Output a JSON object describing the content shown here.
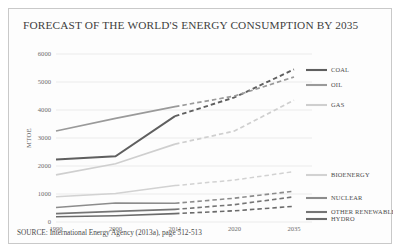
{
  "chart_data": {
    "type": "line",
    "title": "FORECAST OF THE WORLD'S ENERGY CONSUMPTION BY 2035",
    "source": "SOURCE: International Energy Agency (2013a), page 512-513",
    "xlabel": "",
    "ylabel": "MTOE",
    "categories": [
      "1990",
      "2000",
      "2011",
      "2020",
      "2035"
    ],
    "x_tick_labels": [
      "1990",
      "2000",
      "2011",
      "2020",
      "2035"
    ],
    "y_tick_labels": [
      "0",
      "1000",
      "2000",
      "3000",
      "4000",
      "5000",
      "6000"
    ],
    "ylim": [
      0,
      6000
    ],
    "y_ticks": [
      0,
      1000,
      2000,
      3000,
      4000,
      5000,
      6000
    ],
    "grid": true,
    "legend_position": "right",
    "forecast_starts_at": "2011",
    "forecast_style": "dashed",
    "series": [
      {
        "name": "COAL",
        "color": "#5f5f5f",
        "width": 1.9,
        "values": [
          2230,
          2350,
          3780,
          4450,
          5450
        ]
      },
      {
        "name": "OIL",
        "color": "#9a9a9a",
        "width": 1.7,
        "values": [
          3250,
          3700,
          4120,
          4500,
          5180
        ]
      },
      {
        "name": "GAS",
        "color": "#cfcfcf",
        "width": 1.7,
        "values": [
          1680,
          2080,
          2780,
          3250,
          4350
        ]
      },
      {
        "name": "BIOENERGY",
        "color": "#d2d2d2",
        "width": 1.5,
        "values": [
          900,
          1020,
          1300,
          1500,
          1800
        ]
      },
      {
        "name": "NUCLEAR",
        "color": "#8c8c8c",
        "width": 1.6,
        "values": [
          520,
          680,
          670,
          850,
          1100
        ]
      },
      {
        "name": "OTHER RENEWABLE",
        "color": "#757575",
        "width": 1.6,
        "values": [
          300,
          380,
          450,
          620,
          900
        ]
      },
      {
        "name": "HYDRO",
        "color": "#6b6b6b",
        "width": 1.6,
        "values": [
          190,
          225,
          300,
          400,
          560
        ]
      }
    ],
    "legend_entries": [
      {
        "label": "COAL",
        "color": "#5f5f5f",
        "y": 61
      },
      {
        "label": "OIL",
        "color": "#9a9a9a",
        "y": 76
      },
      {
        "label": "GAS",
        "color": "#cfcfcf",
        "y": 96
      },
      {
        "label": "BIOENERGY",
        "color": "#d2d2d2",
        "y": 166
      },
      {
        "label": "NUCLEAR",
        "color": "#8c8c8c",
        "y": 189
      },
      {
        "label": "OTHER RENEWABLE",
        "color": "#757575",
        "y": 203
      },
      {
        "label": "HYDRO",
        "color": "#6b6b6b",
        "y": 210
      }
    ]
  }
}
